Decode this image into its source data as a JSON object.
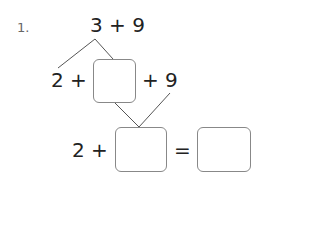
{
  "problem": {
    "number": "1.",
    "top_expression": "3 + 9",
    "row2": {
      "left": "2 +",
      "box": "",
      "right": "+ 9"
    },
    "row3": {
      "left": "2 +",
      "box": "",
      "equals": "=",
      "result_box": ""
    }
  },
  "colors": {
    "text": "#222222",
    "line": "#555555",
    "box_border": "#888888",
    "number": "#666666"
  }
}
